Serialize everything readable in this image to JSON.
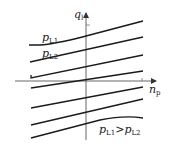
{
  "diagram": {
    "axes": {
      "y_label": "q",
      "y_sub": "l",
      "x_label": "n",
      "x_sub": "p"
    },
    "curve_labels": {
      "first": {
        "sym": "p",
        "sub": "L1"
      },
      "second": {
        "sym": "p",
        "sub": "L2"
      }
    },
    "relation": {
      "left_sym": "p",
      "left_sub": "L1",
      "op": ">",
      "right_sym": "p",
      "right_sub": "L2"
    },
    "line_color": "#1a1a1a",
    "axis_color": "#555555",
    "curves_count": 7
  }
}
